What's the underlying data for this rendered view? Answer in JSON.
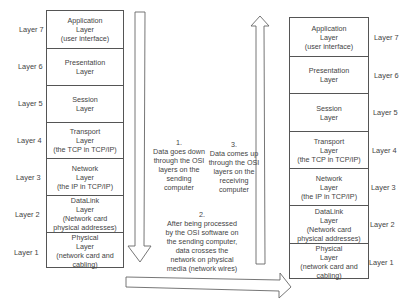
{
  "sending_stack": {
    "layers": [
      {
        "level": "Layer 7",
        "name": "Application\nLayer\n(user interface)"
      },
      {
        "level": "Layer 6",
        "name": "Presentation\nLayer"
      },
      {
        "level": "Layer 5",
        "name": "Session\nLayer"
      },
      {
        "level": "Layer 4",
        "name": "Transport\nLayer\n(the TCP in TCP/IP)"
      },
      {
        "level": "Layer 3",
        "name": "Network\nLayer\n(the IP in TCP/IP)"
      },
      {
        "level": "Layer 2",
        "name": "DataLink\nLayer\n(Network card\nphysical addresses)"
      },
      {
        "level": "Layer 1",
        "name": "Physical\nLayer\n(network card and\ncabling)"
      }
    ]
  },
  "receiving_stack": {
    "layers": [
      {
        "level": "Layer 7",
        "name": "Application\nLayer\n(user interface)"
      },
      {
        "level": "Layer 6",
        "name": "Presentation\nLayer"
      },
      {
        "level": "Layer 5",
        "name": "Session\nLayer"
      },
      {
        "level": "Layer 4",
        "name": "Transport\nLayer\n(the TCP in TCP/IP)"
      },
      {
        "level": "Layer 3",
        "name": "Network\nLayer\n(the IP in TCP/IP)"
      },
      {
        "level": "Layer 2",
        "name": "DataLink\nLayer\n(Network card\nphysical addresses)"
      },
      {
        "level": "Layer 1",
        "name": "Physical\nLayer\n(network card and\ncabling)"
      }
    ]
  },
  "notes": {
    "step1": "1.\nData goes down\nthrough the OSI\nlayers on the\nsending\ncomputer",
    "step2": "2.\nAfter being processed\nby the OSI software on\nthe sending computer,\ndata crosses the\nnetwork on physical\nmedia (network wires)",
    "step3": "3.\nData comes up\nthrough the OSI\nlayers on the\nreceiving\ncomputer"
  },
  "colors": {
    "line": "#555555",
    "text": "#444444",
    "background": "#ffffff"
  }
}
